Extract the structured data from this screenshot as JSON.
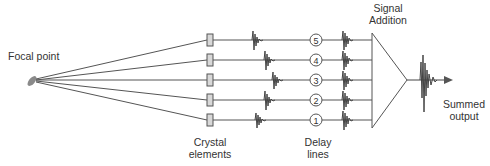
{
  "diagram": {
    "labels": {
      "focal_point": "Focal point",
      "crystal_elements_line1": "Crystal",
      "crystal_elements_line2": "elements",
      "delay_lines_line1": "Delay",
      "delay_lines_line2": "lines",
      "signal_addition_line1": "Signal",
      "signal_addition_line2": "Addition",
      "summed_output_line1": "Summed",
      "summed_output_line2": "output"
    },
    "channels": [
      {
        "number": "5",
        "y": 40,
        "raw_wavelet_x": 254
      },
      {
        "number": "4",
        "y": 60,
        "raw_wavelet_x": 266
      },
      {
        "number": "3",
        "y": 80,
        "raw_wavelet_x": 274
      },
      {
        "number": "2",
        "y": 100,
        "raw_wavelet_x": 266
      },
      {
        "number": "1",
        "y": 120,
        "raw_wavelet_x": 257
      }
    ],
    "colors": {
      "line": "#555555",
      "element_fill": "#d8d8d8",
      "focal_fill": "#888888",
      "text": "#333333"
    }
  }
}
